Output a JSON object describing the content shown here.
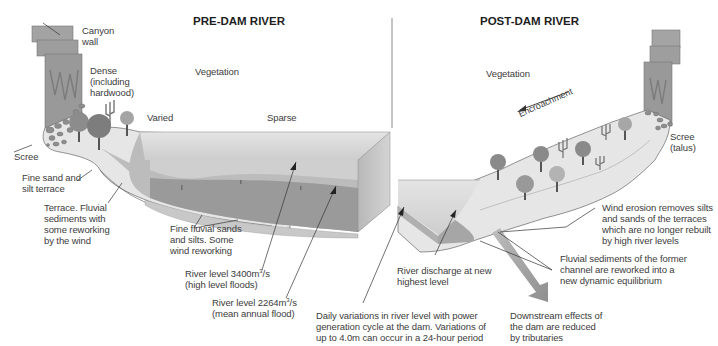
{
  "pre_dam": {
    "title": "PRE-DAM RIVER",
    "labels": {
      "canyon_wall": "Canyon\nwall",
      "dense": "Dense\n(including\nhardwood)",
      "vegetation": "Vegetation",
      "varied": "Varied",
      "sparse": "Sparse",
      "scree": "Scree",
      "fine_sand_terrace": "Fine sand and\nsilt terrace",
      "terrace_fluvial": "Terrace. Fluvial\nsediments with\nsome reworking\nby the wind",
      "fine_fluvial": "Fine fluvial sands\nand silts. Some\nwind reworking",
      "river_level_high_prefix": "River level 3400m",
      "river_level_high_sup": "3",
      "river_level_high_suffix": "/s",
      "river_level_high_note": "(high level floods)",
      "river_level_mean_prefix": "River level 2264m",
      "river_level_mean_sup": "3",
      "river_level_mean_suffix": "/s",
      "river_level_mean_note": "(mean annual flood)"
    }
  },
  "post_dam": {
    "title": "POST-DAM RIVER",
    "labels": {
      "vegetation": "Vegetation",
      "encroachment": "Encroachment",
      "scree_talus": "Scree\n(talus)",
      "wind_erosion": "Wind erosion removes silts\nand sands of the terraces\nwhich are no longer rebuilt\nby high river levels",
      "fluvial_sediments": "Fluvial sediments of the former\nchannel are reworked into a\nnew dynamic equilibrium",
      "river_discharge": "River discharge at new\nhighest level",
      "daily_variations": "Daily variations in river level with power\ngeneration cycle at the dam. Variations of\nup to 4.0m can occur in a 24-hour period",
      "downstream": "Downstream effects of\nthe dam are reduced\nby tributaries"
    }
  },
  "colors": {
    "canyon": "#9a9a9a",
    "water_top": "#d6d6d6",
    "water_mid": "#a9a9a9",
    "water_deep": "#8c8c8c",
    "sediment": "#c4c4c4",
    "tree": "#8a8a8a",
    "text": "#3c3c3c"
  }
}
